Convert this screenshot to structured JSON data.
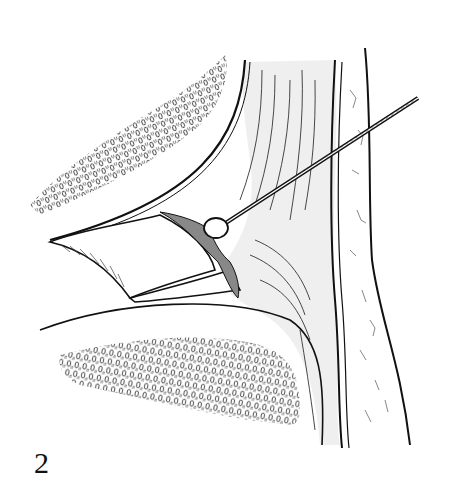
{
  "figure": {
    "label": "2",
    "type": "anatomical line illustration",
    "colors": {
      "ink": "#111111",
      "tissue_shade": "#efefef",
      "background": "#ffffff"
    }
  }
}
